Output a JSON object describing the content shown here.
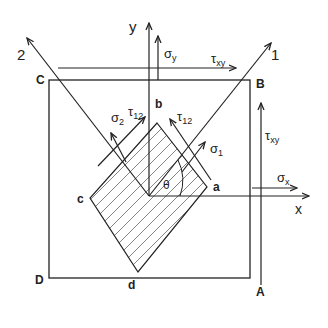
{
  "diagram": {
    "type": "plane-stress-element",
    "colors": {
      "line": "#222222",
      "hatch": "#555555",
      "background": "#ffffff"
    },
    "outer_square": {
      "corners": {
        "C": "C",
        "B": "B",
        "A": "A",
        "D": "D"
      }
    },
    "inner_element": {
      "corners": {
        "a": "a",
        "b": "b",
        "c": "c",
        "d": "d"
      },
      "hatched": true
    },
    "axes": {
      "x": "x",
      "y": "y",
      "principal_1": "1",
      "principal_2": "2"
    },
    "angle": "θ",
    "stresses": {
      "sigma_x": {
        "symbol": "σ",
        "sub": "x"
      },
      "sigma_y": {
        "symbol": "σ",
        "sub": "y"
      },
      "tau_xy_top": {
        "symbol": "τ",
        "sub": "xy"
      },
      "tau_xy_right": {
        "symbol": "τ",
        "sub": "xy"
      },
      "sigma_1": {
        "symbol": "σ",
        "sub": "1"
      },
      "sigma_2": {
        "symbol": "σ",
        "sub": "2"
      },
      "tau_12_left": {
        "symbol": "τ",
        "sub": "12"
      },
      "tau_12_right": {
        "symbol": "τ",
        "sub": "12"
      }
    }
  }
}
